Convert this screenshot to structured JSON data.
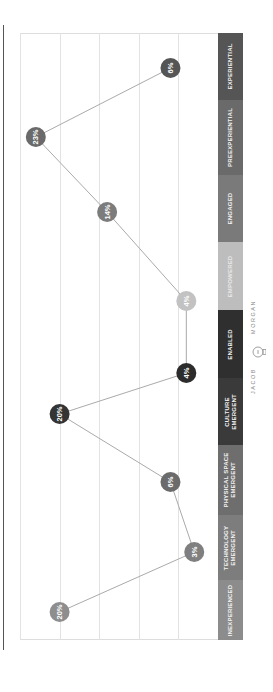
{
  "chart_data": {
    "type": "line",
    "orientation": "rotated-90-ccw",
    "title": "",
    "xlabel": "",
    "ylabel": "",
    "categories": [
      "INEXPERIENCED",
      "TECHNOLOGY EMERGENT",
      "PHYSICAL SPACE EMERGENT",
      "CULTURE EMERGENT",
      "ENABLED",
      "EMPOWERED",
      "ENGAGED",
      "PREEXPERIENTIAL",
      "EXPERIENTIAL"
    ],
    "series": [
      {
        "name": "Share of organizations",
        "values": [
          20,
          3,
          6,
          20,
          4,
          4,
          14,
          23,
          6
        ],
        "labels": [
          "20%",
          "3%",
          "6%",
          "20%",
          "4%",
          "4%",
          "14%",
          "23%",
          "6%"
        ]
      }
    ],
    "ylim": [
      0,
      25
    ],
    "grid": true,
    "legend": "none",
    "category_colors": [
      "#8c8c8c",
      "#7d7d7d",
      "#6e6e6e",
      "#3a3a3a",
      "#2f2f2f",
      "#bdbdbd",
      "#7a7a7a",
      "#6a6a6a",
      "#555555"
    ],
    "node_colors": [
      "#8e8e8e",
      "#7f7f7f",
      "#6b6b6b",
      "#343434",
      "#2c2c2c",
      "#c2c2c2",
      "#7c7c7c",
      "#6a6a6a",
      "#555555"
    ]
  },
  "category_bar": {
    "segments": [
      {
        "label_lines": [
          "INEXPERIENCED"
        ]
      },
      {
        "label_lines": [
          "TECHNOLOGY",
          "EMERGENT"
        ]
      },
      {
        "label_lines": [
          "PHYSICAL SPACE",
          "EMERGENT"
        ]
      },
      {
        "label_lines": [
          "CULTURE",
          "EMERGENT"
        ]
      },
      {
        "label_lines": [
          "ENABLED"
        ]
      },
      {
        "label_lines": [
          "EMPOWERED"
        ]
      },
      {
        "label_lines": [
          "ENGAGED"
        ]
      },
      {
        "label_lines": [
          "PREEXPERIENTIAL"
        ]
      },
      {
        "label_lines": [
          "EXPERIENTIAL"
        ]
      }
    ]
  },
  "logo": {
    "left_text": "JACOB",
    "right_text": "MORGAN",
    "icon": "lightbulb-icon"
  },
  "colors": {
    "line": "#aaaaaa",
    "grid": "#e2e2e2",
    "rule": "#555555"
  }
}
